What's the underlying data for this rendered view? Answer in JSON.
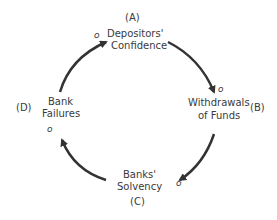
{
  "diagram": {
    "type": "causal-loop",
    "nodes": [
      {
        "id": "A",
        "tag": "(A)",
        "line1": "Depositors'",
        "line2": "Confidence"
      },
      {
        "id": "B",
        "tag": "(B)",
        "line1": "Withdrawals",
        "line2": "of Funds"
      },
      {
        "id": "C",
        "tag": "(C)",
        "line1": "Banks'",
        "line2": "Solvency"
      },
      {
        "id": "D",
        "tag": "(D)",
        "line1": "Bank",
        "line2": "Failures"
      }
    ],
    "links": [
      {
        "from": "A",
        "to": "B",
        "polarity": "o"
      },
      {
        "from": "B",
        "to": "C",
        "polarity": "o"
      },
      {
        "from": "C",
        "to": "D",
        "polarity": "o"
      },
      {
        "from": "D",
        "to": "A",
        "polarity": "o"
      }
    ],
    "arrow_color": "#333333"
  }
}
